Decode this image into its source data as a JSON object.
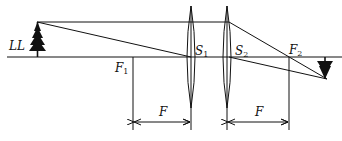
{
  "diagram": {
    "type": "optical-ray-diagram",
    "labels": {
      "object": "LL",
      "focal_point_1": {
        "main": "F",
        "sub": "1"
      },
      "lens_center_1": {
        "main": "S",
        "sub": "1"
      },
      "lens_center_2": {
        "main": "S",
        "sub": "2"
      },
      "focal_point_2": {
        "main": "F",
        "sub": "2"
      },
      "focal_length_left": "F",
      "focal_length_right": "F"
    },
    "colors": {
      "line": "#111111",
      "background": "#ffffff"
    }
  }
}
